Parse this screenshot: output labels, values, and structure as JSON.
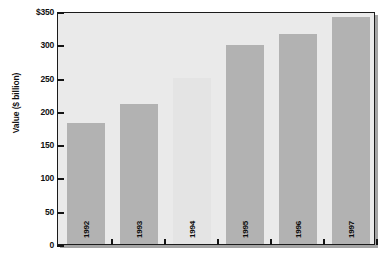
{
  "chart_data": {
    "type": "bar",
    "title": "",
    "xlabel": "",
    "ylabel": "Value ($ billion)",
    "categories": [
      "1992",
      "1993",
      "1994",
      "1995",
      "1996",
      "1997"
    ],
    "values": [
      182,
      210,
      249,
      299,
      315,
      341
    ],
    "ylim": [
      0,
      350
    ],
    "yticks": [
      0,
      50,
      100,
      150,
      200,
      250,
      300,
      350
    ],
    "ytick_labels": [
      "0",
      "50",
      "100",
      "150",
      "200",
      "250",
      "300",
      "$350"
    ],
    "grid": false,
    "legend": false,
    "series": [
      {
        "name": "Value",
        "values": [
          182,
          210,
          249,
          299,
          315,
          341
        ]
      }
    ],
    "bar_colors": [
      "#b2b2b2",
      "#b2b2b2",
      "#e4e4e4",
      "#b2b2b2",
      "#b2b2b2",
      "#b2b2b2"
    ],
    "plot_background": "#eaeaea",
    "axis_color": "#141414"
  },
  "axis": {
    "y_title": "Value ($ billion)"
  }
}
